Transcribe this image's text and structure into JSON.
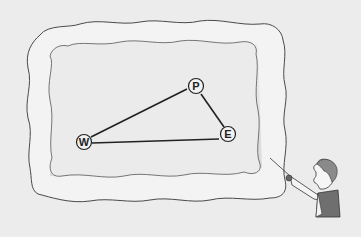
{
  "scene": {
    "description": "Cloud-shaped frame containing a triangle diagram with a figure pointing at it",
    "background": "#ececec",
    "cloud_fill": "#f4f4f4",
    "cloud_shadow": "#bdbdbd",
    "line_color": "#222222"
  },
  "diagram": {
    "nodes": [
      {
        "id": "P",
        "label": "P",
        "x": 196,
        "y": 86
      },
      {
        "id": "E",
        "label": "E",
        "x": 228,
        "y": 134
      },
      {
        "id": "W",
        "label": "W",
        "x": 84,
        "y": 142
      }
    ],
    "edges": [
      {
        "from": "W",
        "to": "P"
      },
      {
        "from": "P",
        "to": "E"
      },
      {
        "from": "W",
        "to": "E"
      }
    ]
  }
}
